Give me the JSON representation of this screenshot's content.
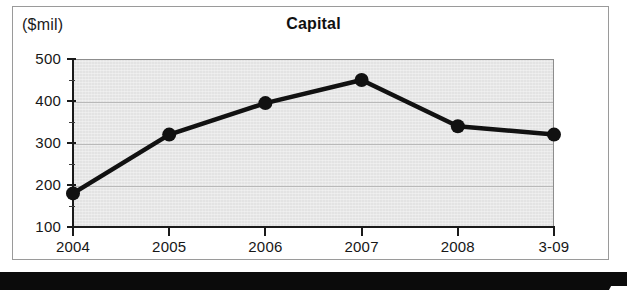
{
  "figure": {
    "units_label": "($mil)",
    "title": "Capital"
  },
  "chart_data": {
    "type": "line",
    "title": "Capital",
    "subtitle": "",
    "xlabel": "",
    "ylabel": "($mil)",
    "units": "$mil",
    "categories": [
      "2004",
      "2005",
      "2006",
      "2007",
      "2008",
      "3-09"
    ],
    "values": [
      180,
      320,
      395,
      450,
      340,
      320
    ],
    "series": [
      {
        "name": "Capital",
        "values": [
          180,
          320,
          395,
          450,
          340,
          320
        ]
      }
    ],
    "ylim": [
      100,
      500
    ],
    "y_ticks": [
      100,
      200,
      300,
      400,
      500
    ],
    "y_tick_labels": [
      "100",
      "200",
      "300",
      "400",
      "500"
    ],
    "y_minor_ticks": [
      150,
      250,
      350,
      450
    ],
    "x_tick_labels": [
      "2004",
      "2005",
      "2006",
      "2007",
      "2008",
      "3-09"
    ],
    "grid": true,
    "grid_axis": "y",
    "legend": false,
    "legend_position": "none",
    "marker": "filled-circle",
    "line_color": "#111111",
    "marker_color": "#111111",
    "plot_background": "#e3e3e3",
    "annotations": []
  }
}
